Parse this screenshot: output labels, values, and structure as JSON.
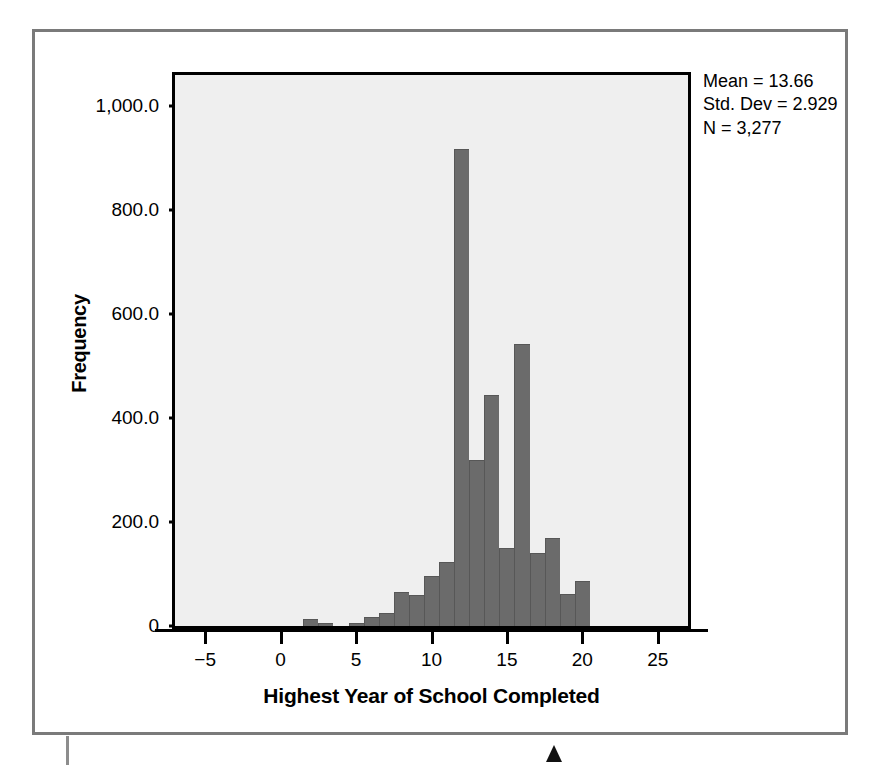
{
  "chart_data": {
    "type": "bar",
    "title": "",
    "xlabel": "Highest Year of School Completed",
    "ylabel": "Frequency",
    "xlim": [
      -7,
      27
    ],
    "ylim": [
      0,
      1060
    ],
    "grid": false,
    "legend": "none",
    "bar_color": "#6b6b6b",
    "plot_background": "#efefef",
    "x_ticks": [
      "−5",
      "0",
      "5",
      "10",
      "15",
      "20",
      "25"
    ],
    "x_tick_values": [
      -5,
      0,
      5,
      10,
      15,
      20,
      25
    ],
    "y_ticks": [
      "0",
      "200.0",
      "400.0",
      "600.0",
      "800.0",
      "1,000.0"
    ],
    "y_tick_values": [
      0,
      200,
      400,
      600,
      800,
      1000
    ],
    "categories": [
      2,
      3,
      5,
      6,
      7,
      8,
      9,
      10,
      11,
      12,
      13,
      14,
      15,
      16,
      17,
      18,
      19,
      20
    ],
    "values": [
      14,
      6,
      6,
      18,
      26,
      66,
      60,
      96,
      124,
      917,
      319,
      445,
      150,
      542,
      141,
      170,
      62,
      86
    ],
    "annotations": [
      "Mean = 13.66",
      "Std. Dev = 2.929",
      "N = 3,277"
    ]
  },
  "statistics": {
    "mean_label": "Mean = 13.66",
    "std_dev_label": "Std. Dev = 2.929",
    "n_label": "N = 3,277"
  },
  "axes": {
    "x_title": "Highest Year of School Completed",
    "y_title": "Frequency"
  }
}
